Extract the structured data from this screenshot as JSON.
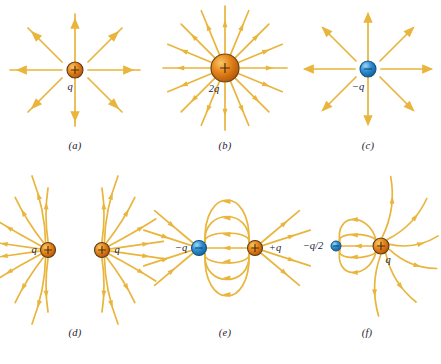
{
  "figure": {
    "background_color": "#ffffff",
    "field_line_color": "#e9b53c",
    "positive_charge_color": "#e07b16",
    "negative_charge_color": "#2f8fd4",
    "label_color": "#1c1c3a"
  },
  "panels": [
    {
      "id": "a",
      "caption": "(a)",
      "charges": [
        {
          "label": "q",
          "sign": "+",
          "symbol": "+",
          "size": "small",
          "color": "#e07b16"
        }
      ],
      "line_count": 8,
      "direction": "outward",
      "description": "Single positive point charge with eight straight field lines radiating outward"
    },
    {
      "id": "b",
      "caption": "(b)",
      "charges": [
        {
          "label": "2q",
          "sign": "+",
          "symbol": "+",
          "size": "large",
          "color": "#e07b16"
        }
      ],
      "line_count": 16,
      "direction": "outward",
      "description": "Point charge of twice the magnitude with sixteen field lines radiating outward"
    },
    {
      "id": "c",
      "caption": "(c)",
      "charges": [
        {
          "label": "−q",
          "sign": "-",
          "symbol": "−",
          "size": "small",
          "color": "#2f8fd4"
        }
      ],
      "line_count": 8,
      "direction": "inward",
      "description": "Single negative point charge with eight straight field lines directed inward"
    },
    {
      "id": "d",
      "caption": "(d)",
      "charges": [
        {
          "label": "q",
          "sign": "+",
          "symbol": "+",
          "size": "small",
          "color": "#e07b16"
        },
        {
          "label": "q",
          "sign": "+",
          "symbol": "+",
          "size": "small",
          "color": "#e07b16"
        }
      ],
      "line_count": 20,
      "direction": "outward",
      "description": "Two equal positive charges; field lines curve away from each other"
    },
    {
      "id": "e",
      "caption": "(e)",
      "charges": [
        {
          "label": "−q",
          "sign": "-",
          "symbol": "−",
          "size": "small",
          "color": "#2f8fd4"
        },
        {
          "label": "+q",
          "sign": "+",
          "symbol": "+",
          "size": "small",
          "color": "#e07b16"
        }
      ],
      "line_count": 12,
      "direction": "positive-to-negative",
      "description": "Electric dipole: equal and opposite charges with lines arcing from the positive to the negative charge"
    },
    {
      "id": "f",
      "caption": "(f)",
      "charges": [
        {
          "label": "−q/2",
          "sign": "-",
          "symbol": "−",
          "size": "tiny",
          "color": "#2f8fd4"
        },
        {
          "label": "q",
          "sign": "+",
          "symbol": "+",
          "size": "small",
          "color": "#e07b16"
        }
      ],
      "line_count": 12,
      "direction": "positive-to-negative",
      "description": "Unequal opposite charges; half of the lines from the positive charge end on the smaller negative charge"
    }
  ]
}
